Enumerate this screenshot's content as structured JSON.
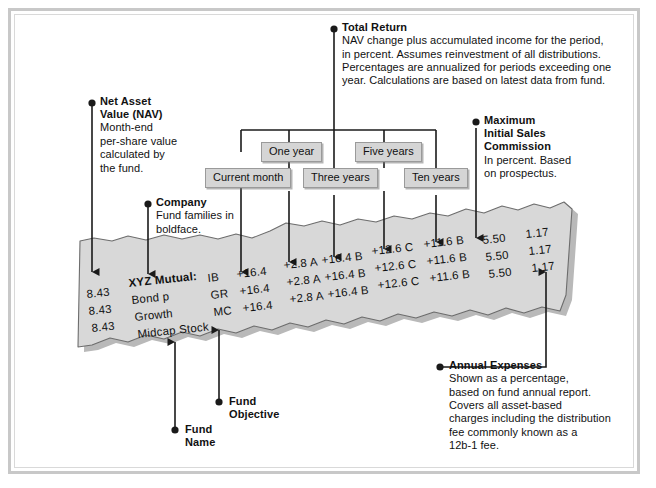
{
  "figure": {
    "paper_color": "#d8d8d8",
    "chip_color": "#d5d5d5",
    "ink_color": "#111111"
  },
  "callouts": {
    "net_asset_value": {
      "heading_line1": "Net Asset",
      "heading_line2": "Value (NAV)",
      "body_line1": "Month-end",
      "body_line2": "per-share value",
      "body_line3": "calculated by",
      "body_line4": "the fund."
    },
    "company": {
      "heading": "Company",
      "body_line1": "Fund families in",
      "body_line2": "boldface."
    },
    "total_return": {
      "heading": "Total Return",
      "body_line1": "NAV change plus accumulated income for the period,",
      "body_line2": "in percent. Assumes reinvestment of all distributions.",
      "body_line3": "Percentages are annualized for periods exceeding one",
      "body_line4": "year. Calculations are based on latest data from fund."
    },
    "max_initial_sales_commission": {
      "heading_line1": "Maximum",
      "heading_line2": "Initial Sales",
      "heading_line3": "Commission",
      "body_line1": "In percent. Based",
      "body_line2": "on prospectus."
    },
    "annual_expenses": {
      "heading": "Annual Expenses",
      "body_line1": "Shown as a percentage,",
      "body_line2": "based on fund annual report.",
      "body_line3": "Covers all asset-based",
      "body_line4": "charges including the distribution",
      "body_line5": "fee commonly known as a",
      "body_line6": "12b-1 fee."
    },
    "fund_name": {
      "heading_line1": "Fund",
      "heading_line2": "Name"
    },
    "fund_objective": {
      "heading_line1": "Fund",
      "heading_line2": "Objective"
    }
  },
  "period_chips": [
    {
      "label": "Current month"
    },
    {
      "label": "One year"
    },
    {
      "label": "Three years"
    },
    {
      "label": "Five years"
    },
    {
      "label": "Ten years"
    }
  ],
  "quote_table": {
    "nav": [
      "8.43",
      "8.43",
      "8.43"
    ],
    "company": "XYZ Mutual:",
    "fund_names": [
      "Bond p",
      "Growth",
      "Midcap Stock"
    ],
    "objectives": [
      "IB",
      "GR",
      "MC"
    ],
    "current_month": [
      "+16.4",
      "+16.4",
      "+16.4"
    ],
    "one_year": [
      "+2.8 A",
      "+2.8 A",
      "+2.8 A"
    ],
    "three_years": [
      "+16.4 B",
      "+16.4 B",
      "+16.4 B"
    ],
    "five_years": [
      "+12.6 C",
      "+12.6 C",
      "+12.6 C"
    ],
    "ten_years": [
      "+11.6 B",
      "+11.6 B",
      "+11.6 B"
    ],
    "sales_commission": [
      "5.50",
      "5.50",
      "5.50"
    ],
    "annual_expenses": [
      "1.17",
      "1.17",
      "1.17"
    ]
  }
}
